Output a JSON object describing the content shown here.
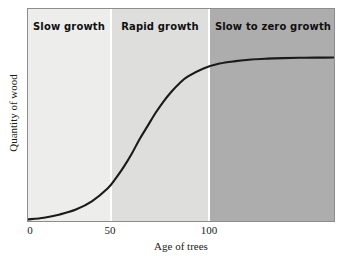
{
  "chart_data": {
    "type": "line",
    "title": "",
    "subtitle": "",
    "xlabel": "Age of trees",
    "ylabel": "Quantity of wood",
    "xticks": [
      "0",
      "50",
      "100"
    ],
    "xtick_values": [
      0,
      50,
      100
    ],
    "yticks": [],
    "xlim": [
      0,
      193
    ],
    "ylim": [
      0,
      100
    ],
    "grid": false,
    "legend": "none",
    "series": [
      {
        "name": "Quantity of wood",
        "x": [
          0,
          10,
          20,
          30,
          40,
          50,
          55,
          60,
          65,
          70,
          75,
          80,
          85,
          90,
          95,
          100,
          110,
          120,
          130,
          140,
          150,
          160,
          170,
          180,
          193
        ],
        "y": [
          1,
          2,
          4,
          7,
          12,
          20,
          26,
          33,
          41,
          50,
          58,
          66,
          73,
          79,
          84,
          88,
          93,
          96,
          97.5,
          98.5,
          99,
          99.3,
          99.5,
          99.6,
          99.7
        ]
      }
    ],
    "annotations": [
      {
        "label": "Slow growth",
        "x_start": 0,
        "x_end": 50
      },
      {
        "label": "Rapid growth",
        "x_start": 50,
        "x_end": 100
      },
      {
        "label": "Slow to zero growth",
        "x_start": 100,
        "x_end": 193
      }
    ],
    "bands": [
      {
        "name": "Slow growth",
        "color": "#ededec"
      },
      {
        "name": "Rapid growth",
        "color": "#dededd"
      },
      {
        "name": "Slow to zero growth",
        "color": "#adadad"
      }
    ],
    "colors": {
      "curve": "#1a1a1a",
      "frame": "#8d8d8d",
      "background": "#ffffff",
      "divider": "#ffffff",
      "band_slow": "#ededec",
      "band_rapid": "#dededd",
      "band_zero": "#adadad",
      "text": "#1b1b1b"
    }
  },
  "bands": {
    "slow": {
      "label": "Slow growth",
      "color": "#ededec"
    },
    "rapid": {
      "label": "Rapid growth",
      "color": "#dededd"
    },
    "zero": {
      "label": "Slow to zero growth",
      "color": "#adadad"
    }
  },
  "axes": {
    "x": {
      "title": "Age of trees",
      "ticks": {
        "t0": "0",
        "t50": "50",
        "t100": "100"
      }
    },
    "y": {
      "title": "Quantity of wood"
    }
  }
}
